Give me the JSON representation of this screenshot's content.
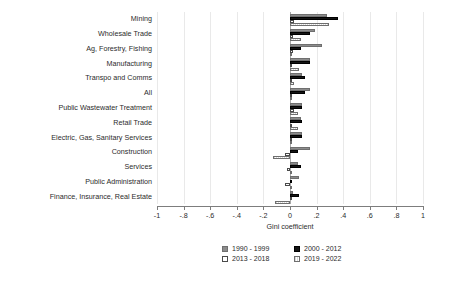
{
  "chart_data": {
    "type": "bar",
    "orientation": "horizontal",
    "title": "",
    "xlabel": "Gini coefficient",
    "ylabel": "",
    "xlim": [
      -1,
      1
    ],
    "xticks": [
      -1,
      -0.8,
      -0.6,
      -0.4,
      -0.2,
      0,
      0.2,
      0.4,
      0.6,
      0.8,
      1
    ],
    "xticklabels": [
      "-1",
      "-.8",
      "-.6",
      "-.4",
      "-.2",
      "0",
      ".2",
      ".4",
      ".6",
      ".8",
      "1"
    ],
    "grid": true,
    "legend_position": "bottom",
    "categories": [
      "Mining",
      "Wholesale Trade",
      "Ag, Forestry, Fishing",
      "Manufacturing",
      "Transpo and Comms",
      "All",
      "Public Wastewater Treatment",
      "Retail Trade",
      "Electric, Gas, Sanitary Services",
      "Construction",
      "Services",
      "Public Administration",
      "Finance, Insurance, Real Estate"
    ],
    "series": [
      {
        "name": "1990 - 1999",
        "color": "#8c8c8c",
        "values": [
          0.28,
          0.19,
          0.24,
          0.15,
          0.09,
          0.15,
          0.09,
          0.08,
          0.09,
          0.15,
          0.06,
          0.07,
          0.02
        ]
      },
      {
        "name": "2000 - 2012",
        "color": "#141414",
        "values": [
          0.36,
          0.15,
          0.08,
          0.15,
          0.11,
          0.11,
          0.09,
          0.09,
          0.09,
          0.06,
          0.08,
          0.01,
          0.07
        ]
      },
      {
        "name": "2013 - 2018",
        "color": "#ffffff",
        "values": [
          0.03,
          0.02,
          0.02,
          0.01,
          0.01,
          0.01,
          0.03,
          0.01,
          0.01,
          -0.04,
          -0.02,
          -0.04,
          0.01
        ]
      },
      {
        "name": "2019 - 2022",
        "color": "#d9d9d9",
        "values": [
          0.29,
          0.08,
          0.01,
          0.07,
          0.03,
          0.01,
          0.06,
          0.06,
          0.0,
          -0.13,
          0.0,
          0.0,
          -0.11
        ]
      }
    ]
  },
  "legend": {
    "items": [
      {
        "label": "1990 - 1999",
        "swatch": "series-0-swatch"
      },
      {
        "label": "2000 - 2012",
        "swatch": "series-1-swatch"
      },
      {
        "label": "2013 - 2018",
        "swatch": "series-2-swatch"
      },
      {
        "label": "2019 - 2022",
        "swatch": "series-3-swatch"
      }
    ]
  }
}
